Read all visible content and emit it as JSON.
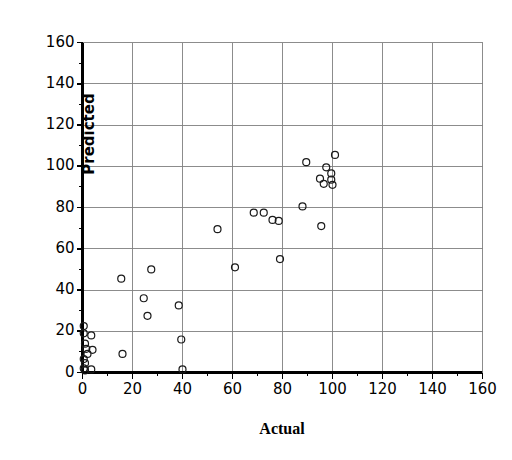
{
  "chart_data": {
    "type": "scatter",
    "title": "",
    "xlabel": "Actual",
    "ylabel": "Predicted",
    "xlim": [
      0,
      160
    ],
    "ylim": [
      0,
      160
    ],
    "xticks": [
      0,
      20,
      40,
      60,
      80,
      100,
      120,
      140,
      160
    ],
    "yticks": [
      0,
      20,
      40,
      60,
      80,
      100,
      120,
      140,
      160
    ],
    "xtick_labels": [
      "0",
      "20",
      "40",
      "60",
      "80",
      "100",
      "120",
      "140",
      "160"
    ],
    "ytick_labels": [
      "0",
      "20",
      "40",
      "60",
      "80",
      "100",
      "120",
      "140",
      "160"
    ],
    "grid": true,
    "grid_interval": 20,
    "minor_tick_interval": 10,
    "legend": "none",
    "marker": "open-circle",
    "marker_size_px": 7,
    "marker_color": "#1a1a1a",
    "marker_fill": "none",
    "axis_color": "#000000",
    "grid_color": "#808080",
    "background": "#ffffff",
    "series": [
      {
        "name": "observations",
        "points": [
          [
            0.5,
            22.5
          ],
          [
            0.5,
            19.0
          ],
          [
            1.0,
            14.0
          ],
          [
            1.5,
            11.5
          ],
          [
            2.0,
            9.0
          ],
          [
            0.5,
            6.5
          ],
          [
            1.0,
            4.5
          ],
          [
            0.5,
            2.0
          ],
          [
            1.0,
            1.0
          ],
          [
            3.5,
            18.0
          ],
          [
            4.0,
            11.0
          ],
          [
            3.5,
            1.5
          ],
          [
            15.5,
            45.5
          ],
          [
            16.0,
            9.0
          ],
          [
            24.5,
            36.0
          ],
          [
            26.0,
            27.5
          ],
          [
            27.5,
            50.0
          ],
          [
            38.5,
            32.5
          ],
          [
            39.5,
            16.0
          ],
          [
            40.0,
            1.5
          ],
          [
            54.0,
            69.5
          ],
          [
            61.0,
            51.0
          ],
          [
            68.5,
            77.5
          ],
          [
            72.5,
            77.5
          ],
          [
            76.0,
            74.0
          ],
          [
            78.5,
            73.5
          ],
          [
            79.0,
            55.0
          ],
          [
            88.0,
            80.5
          ],
          [
            89.5,
            102.0
          ],
          [
            95.0,
            94.0
          ],
          [
            95.5,
            71.0
          ],
          [
            96.5,
            91.5
          ],
          [
            97.5,
            99.5
          ],
          [
            99.5,
            96.5
          ],
          [
            99.5,
            93.5
          ],
          [
            100.0,
            91.0
          ],
          [
            101.0,
            105.5
          ]
        ]
      }
    ]
  },
  "axes": {
    "y_title": "Predicted",
    "x_title": "Actual"
  }
}
